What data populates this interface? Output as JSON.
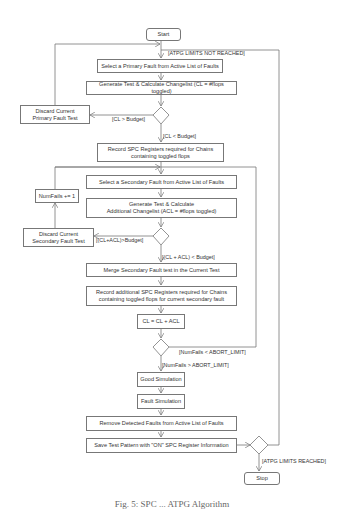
{
  "flowchart": {
    "nodes": {
      "start": "Start",
      "select_primary": "Select a Primary Fault from Active List of Faults",
      "generate_test": "Generate Test & Calculate Changelist (CL = #flops toggled)",
      "discard_primary": "Discard Current\nPrimary Fault Test",
      "record_spc": "Record SPC Registers required for Chains\ncontaining toggled flops",
      "select_secondary": "Select a Secondary Fault from Active List of Faults",
      "numfails": "NumFails += 1",
      "generate_additional": "Generate Test & Calculate\nAdditional Changelist (ACL = #flops toggled)",
      "discard_secondary": "Discard Current\nSecondary Fault Test",
      "merge_secondary": "Merge Secondary Fault test in the Current Test",
      "record_additional": "Record additional SPC Registers required for Chains\ncontaining toggled flops for current secondary fault",
      "cl_update": "CL = CL + ACL",
      "good_sim": "Good Simulation",
      "fault_sim": "Fault Simulation",
      "remove_detected": "Remove Detected Faults from Active List of Faults",
      "save_pattern": "Save Test Pattern with \"ON\" SPC Register Information",
      "stop": "Stop"
    },
    "edge_labels": {
      "atpg_not_reached": "[ATPG LIMITS NOT REACHED]",
      "cl_gt_budget": "[CL > Budget]",
      "cl_lt_budget": "[CL < Budget]",
      "cl_acl_gt_budget": "[(CL+ACL)>Budget]",
      "cl_acl_lt_budget": "[(CL + ACL) < Budget]",
      "numfails_lt_abort": "[NumFails < ABORT_LIMIT]",
      "numfails_gt_abort": "[NumFails > ABORT_LIMIT]",
      "atpg_reached": "[ATPG LIMITS REACHED]"
    }
  },
  "caption": "Fig. 5: SPC ... ATPG Algorithm"
}
